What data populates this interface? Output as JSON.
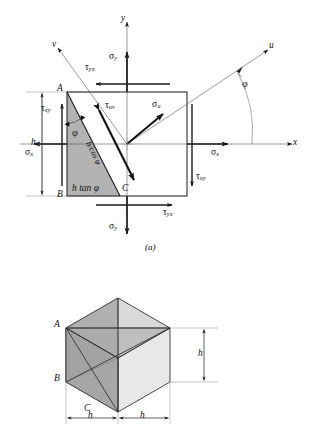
{
  "figure": {
    "caption_a": "(a)",
    "panels": [
      {
        "id": "a",
        "type": "2d-stress-element",
        "description": "Square stress element with shaded triangular wedge ABC cut at angle phi, showing normal and shear stresses on x, y faces and on the inclined u-v face."
      },
      {
        "id": "b",
        "type": "isometric-wedge",
        "description": "Isometric cube of side h showing the three-dimensional wedge with corner points A, B and C."
      }
    ]
  },
  "panel_a": {
    "axes": {
      "x_label": "x",
      "y_label": "y",
      "u_label": "u",
      "v_label": "v"
    },
    "angles": {
      "phi_outer": "φ",
      "phi_inner": "φ"
    },
    "stresses": {
      "sigma_x_left": {
        "symbol": "σ",
        "sub": "x"
      },
      "sigma_x_right": {
        "symbol": "σ",
        "sub": "x"
      },
      "sigma_y_top": {
        "symbol": "σ",
        "sub": "y"
      },
      "sigma_y_bottom": {
        "symbol": "σ",
        "sub": "y"
      },
      "tau_xy_left": {
        "symbol": "τ",
        "sub": "xy"
      },
      "tau_xy_right": {
        "symbol": "τ",
        "sub": "xy"
      },
      "tau_yx_top": {
        "symbol": "τ",
        "sub": "yx"
      },
      "tau_yx_bottom": {
        "symbol": "τ",
        "sub": "yx"
      },
      "sigma_u": {
        "symbol": "σ",
        "sub": "u"
      },
      "tau_uv": {
        "symbol": "τ",
        "sub": "uv"
      }
    },
    "points": {
      "A": "A",
      "B": "B",
      "C": "C"
    },
    "dimensions": {
      "height_h": "h",
      "base": "h tan φ",
      "hypotenuse": "h/cos φ"
    }
  },
  "panel_b": {
    "points": {
      "A": "A",
      "B": "B",
      "C": "C"
    },
    "dimensions": {
      "vertical_h": "h",
      "left_h": "h",
      "right_h": "h"
    }
  },
  "colors": {
    "wedge_fill": "#b3b3b3",
    "cube_face_light": "#d9d9d9",
    "cube_face_mid": "#bdbdbd",
    "cube_face_dark": "#a6a6a6",
    "line": "#1a1a1a",
    "thin_line": "#7d7d7d",
    "background": "#ffffff"
  }
}
